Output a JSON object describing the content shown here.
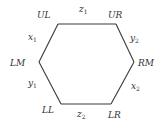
{
  "diagram": {
    "type": "hexagon",
    "stroke_color": "#3a3a3a",
    "vertices": {
      "UL": {
        "label": "UL",
        "x": 58,
        "y": 24
      },
      "UR": {
        "label": "UR",
        "x": 116,
        "y": 24
      },
      "RM": {
        "label": "RM",
        "x": 134,
        "y": 62
      },
      "LR": {
        "label": "LR",
        "x": 111,
        "y": 104
      },
      "LL": {
        "label": "LL",
        "x": 61,
        "y": 104
      },
      "LM": {
        "label": "LM",
        "x": 39,
        "y": 62
      }
    },
    "edges": {
      "top": {
        "from": "UL",
        "to": "UR",
        "var": "z",
        "sub": "1"
      },
      "upper_right": {
        "from": "UR",
        "to": "RM",
        "var": "y",
        "sub": "2"
      },
      "lower_right": {
        "from": "RM",
        "to": "LR",
        "var": "x",
        "sub": "2"
      },
      "bottom": {
        "from": "LL",
        "to": "LR",
        "var": "z",
        "sub": "2"
      },
      "lower_left": {
        "from": "LM",
        "to": "LL",
        "var": "y",
        "sub": "1"
      },
      "upper_left": {
        "from": "UL",
        "to": "LM",
        "var": "x",
        "sub": "1"
      }
    }
  }
}
